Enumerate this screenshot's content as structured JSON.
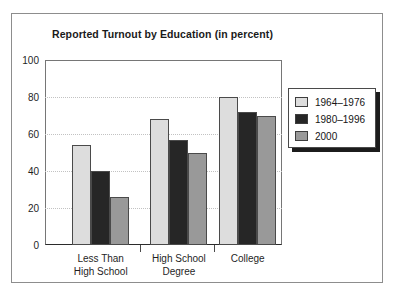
{
  "chart_data": {
    "type": "bar",
    "title": "Reported Turnout by Education (in percent)",
    "xlabel": "",
    "ylabel": "",
    "categories": [
      "Less Than High School",
      "High School Degree",
      "College"
    ],
    "category_lines": [
      [
        "Less Than",
        "High School"
      ],
      [
        "High School",
        "Degree"
      ],
      [
        "College"
      ]
    ],
    "series": [
      {
        "name": "1964–1976",
        "color": "#dddddd",
        "values": [
          54,
          68,
          80
        ]
      },
      {
        "name": "1980–1996",
        "color": "#262626",
        "values": [
          40,
          57,
          72
        ]
      },
      {
        "name": "2000",
        "color": "#999999",
        "values": [
          26,
          50,
          70
        ]
      }
    ],
    "ylim": [
      0,
      100
    ],
    "yticks": [
      0,
      20,
      40,
      60,
      80,
      100
    ],
    "ytick_labels": [
      "0",
      "20",
      "40",
      "60",
      "80",
      "100"
    ],
    "grid": true,
    "grid_style": "dotted",
    "legend_position": "right",
    "legend_entries": [
      "1964–1976",
      "1980–1996",
      "2000"
    ]
  },
  "colors": {
    "series_light": "#dddddd",
    "series_dark": "#262626",
    "series_mid": "#999999",
    "axis": "#4a4a4a",
    "grid": "#c2c2c2",
    "frame": "#8d8d8d",
    "text": "#1a1a1a",
    "legend_shadow": "#1c1c1c"
  }
}
